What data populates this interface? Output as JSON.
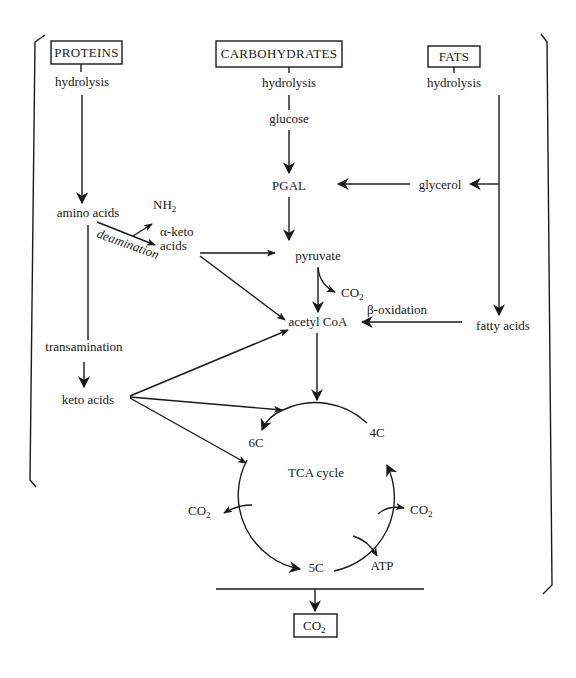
{
  "diagram": {
    "sources": {
      "proteins": "PROTEINS",
      "carbohydrates": "CARBOHYDRATES",
      "fats": "FATS"
    },
    "nodes": {
      "hydrolysis_proteins": "hydrolysis",
      "hydrolysis_carbs": "hydrolysis",
      "hydrolysis_fats": "hydrolysis",
      "glucose": "glucose",
      "pgal": "PGAL",
      "glycerol": "glycerol",
      "amino_acids": "amino acids",
      "nh2": "NH",
      "nh2_sub": "2",
      "alpha_keto_1": "α-keto",
      "alpha_keto_2": "acids",
      "deamination": "deamination",
      "pyruvate": "pyruvate",
      "co2_pyruvate": "CO",
      "co2_pyruvate_sub": "2",
      "beta_oxidation": "β-oxidation",
      "acetyl_coa": "acetyl CoA",
      "fatty_acids": "fatty acids",
      "transamination": "transamination",
      "keto_acids": "keto acids",
      "tca_cycle": "TCA cycle",
      "c6": "6C",
      "c5": "5C",
      "c4": "4C",
      "co2_left": "CO",
      "co2_left_sub": "2",
      "co2_right": "CO",
      "co2_right_sub": "2",
      "atp": "ATP",
      "co2_final": "CO",
      "co2_final_sub": "2"
    },
    "edges": [
      {
        "from": "PROTEINS",
        "to": "amino acids",
        "label": "hydrolysis"
      },
      {
        "from": "CARBOHYDRATES",
        "to": "glucose",
        "label": "hydrolysis"
      },
      {
        "from": "glucose",
        "to": "PGAL"
      },
      {
        "from": "PGAL",
        "to": "pyruvate"
      },
      {
        "from": "FATS",
        "to": "glycerol",
        "label": "hydrolysis"
      },
      {
        "from": "FATS",
        "to": "fatty acids",
        "label": "hydrolysis"
      },
      {
        "from": "glycerol",
        "to": "PGAL"
      },
      {
        "from": "amino acids",
        "to": "α-keto acids",
        "label": "deamination"
      },
      {
        "from": "amino acids",
        "to": "NH2"
      },
      {
        "from": "α-keto acids",
        "to": "pyruvate"
      },
      {
        "from": "α-keto acids",
        "to": "acetyl CoA"
      },
      {
        "from": "pyruvate",
        "to": "acetyl CoA"
      },
      {
        "from": "pyruvate",
        "to": "CO2"
      },
      {
        "from": "fatty acids",
        "to": "acetyl CoA",
        "label": "β-oxidation"
      },
      {
        "from": "amino acids",
        "to": "keto acids",
        "label": "transamination"
      },
      {
        "from": "keto acids",
        "to": "acetyl CoA"
      },
      {
        "from": "keto acids",
        "to": "TCA cycle"
      },
      {
        "from": "keto acids",
        "to": "6C"
      },
      {
        "from": "acetyl CoA",
        "to": "TCA cycle"
      },
      {
        "from": "6C",
        "to": "5C"
      },
      {
        "from": "6C",
        "to": "CO2"
      },
      {
        "from": "5C",
        "to": "4C"
      },
      {
        "from": "5C",
        "to": "CO2"
      },
      {
        "from": "5C",
        "to": "ATP"
      },
      {
        "from": "4C",
        "to": "6C"
      },
      {
        "from": "all",
        "to": "CO2"
      }
    ]
  }
}
